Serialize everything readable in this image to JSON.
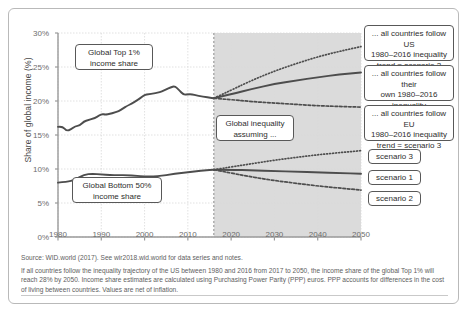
{
  "figure": {
    "y_axis_title": "Share of global income (%)",
    "y_ticks": [
      "30%",
      "25%",
      "20%",
      "15%",
      "10%",
      "5%",
      "0%"
    ],
    "x_ticks": [
      "1980",
      "1990",
      "2000",
      "2010",
      "2020",
      "2030",
      "2040",
      "2050"
    ],
    "callouts": {
      "top1": "Global Top 1%\nincome share",
      "bottom50": "Global Bottom 50%\nincome share",
      "assuming": "Global inequality\nassuming ...",
      "scenario2_desc": "... all countries follow US\n1980–2016 inequality\ntrend = scenario 2",
      "scenario1_desc": "... all countries follow their\nown 1980–2016 inequality\ntrend = scenario 1",
      "scenario3_desc": "... all countries follow EU\n1980–2016 inequality\ntrend = scenario 3",
      "tag_scenario3": "scenario 3",
      "tag_scenario1": "scenario 1",
      "tag_scenario2": "scenario 2"
    },
    "footnote": {
      "source": "Source: WID.world (2017). See wir2018.wid.world for data series and notes.",
      "note": "If all countries follow the inequality trajectory of the US between 1980 and 2016 from 2017 to 2050, the  income share of the global Top 1% will reach 28% by 2050. Income share estimates are calculated using Purchasing Power Parity (PPP) euros. PPP accounts for differences in the cost of living between countries. Values are net of inflation."
    },
    "colors": {
      "line": "#4d4d4d",
      "projection_band": "#cfcfcf",
      "grid": "#d9d9d9",
      "axis": "#9a9a9a",
      "border": "#585858"
    }
  },
  "chart_data": {
    "type": "line",
    "title": "",
    "xlabel": "",
    "ylabel": "Share of global income (%)",
    "xlim": [
      1980,
      2050
    ],
    "ylim": [
      0,
      30
    ],
    "ytick_values": [
      0,
      5,
      10,
      15,
      20,
      25,
      30
    ],
    "xtick_values": [
      1980,
      1990,
      2000,
      2010,
      2020,
      2030,
      2040,
      2050
    ],
    "grid": true,
    "legend": "inline-callouts",
    "projection_start": 2016,
    "series": [
      {
        "name": "Global Top 1% income share (historical)",
        "style": "solid",
        "x": [
          1980,
          1981,
          1982,
          1983,
          1984,
          1985,
          1986,
          1987,
          1988,
          1989,
          1990,
          1991,
          1992,
          1993,
          1994,
          1995,
          1996,
          1997,
          1998,
          1999,
          2000,
          2001,
          2002,
          2003,
          2004,
          2005,
          2006,
          2007,
          2008,
          2009,
          2010,
          2011,
          2012,
          2013,
          2014,
          2015,
          2016
        ],
        "y": [
          16.2,
          16.3,
          15.6,
          15.8,
          16.3,
          16.4,
          17.0,
          17.2,
          17.4,
          17.6,
          18.1,
          18.0,
          18.1,
          18.3,
          18.5,
          18.9,
          19.3,
          19.6,
          20.0,
          20.4,
          20.9,
          21.0,
          21.1,
          21.2,
          21.4,
          21.7,
          22.0,
          22.2,
          21.6,
          20.9,
          21.0,
          21.0,
          20.8,
          20.7,
          20.6,
          20.5,
          20.4
        ]
      },
      {
        "name": "Top 1% – scenario 2 (all countries follow US trend)",
        "style": "dotted",
        "x": [
          2016,
          2020,
          2025,
          2030,
          2035,
          2040,
          2045,
          2050
        ],
        "y": [
          20.4,
          21.6,
          23.1,
          24.4,
          25.5,
          26.5,
          27.3,
          28.0
        ]
      },
      {
        "name": "Top 1% – scenario 1 (countries follow own trend)",
        "style": "solid",
        "x": [
          2016,
          2020,
          2025,
          2030,
          2035,
          2040,
          2045,
          2050
        ],
        "y": [
          20.4,
          21.0,
          21.8,
          22.5,
          23.0,
          23.5,
          23.9,
          24.2
        ]
      },
      {
        "name": "Top 1% – scenario 3 (all countries follow EU trend)",
        "style": "dashed",
        "x": [
          2016,
          2020,
          2025,
          2030,
          2035,
          2040,
          2045,
          2050
        ],
        "y": [
          20.4,
          20.2,
          19.9,
          19.7,
          19.5,
          19.3,
          19.2,
          19.1
        ]
      },
      {
        "name": "Global Bottom 50% income share (historical)",
        "style": "solid",
        "x": [
          1980,
          1982,
          1984,
          1986,
          1988,
          1990,
          1992,
          1994,
          1996,
          1998,
          2000,
          2002,
          2004,
          2006,
          2008,
          2010,
          2012,
          2014,
          2016
        ],
        "y": [
          8.0,
          8.1,
          8.4,
          9.2,
          9.3,
          9.2,
          9.1,
          9.1,
          9.1,
          9.0,
          8.9,
          8.9,
          9.0,
          9.2,
          9.4,
          9.5,
          9.7,
          9.8,
          9.9
        ]
      },
      {
        "name": "Bottom 50% – scenario 3 (all countries follow EU trend)",
        "style": "dotted",
        "x": [
          2016,
          2020,
          2025,
          2030,
          2035,
          2040,
          2045,
          2050
        ],
        "y": [
          9.9,
          10.3,
          10.8,
          11.3,
          11.7,
          12.1,
          12.4,
          12.7
        ]
      },
      {
        "name": "Bottom 50% – scenario 1 (countries follow own trend)",
        "style": "solid",
        "x": [
          2016,
          2020,
          2025,
          2030,
          2035,
          2040,
          2045,
          2050
        ],
        "y": [
          9.9,
          9.9,
          9.8,
          9.7,
          9.6,
          9.5,
          9.4,
          9.3
        ]
      },
      {
        "name": "Bottom 50% – scenario 2 (all countries follow US trend)",
        "style": "dashed",
        "x": [
          2016,
          2020,
          2025,
          2030,
          2035,
          2040,
          2045,
          2050
        ],
        "y": [
          9.9,
          9.4,
          8.8,
          8.3,
          7.9,
          7.5,
          7.2,
          6.9
        ]
      }
    ]
  }
}
